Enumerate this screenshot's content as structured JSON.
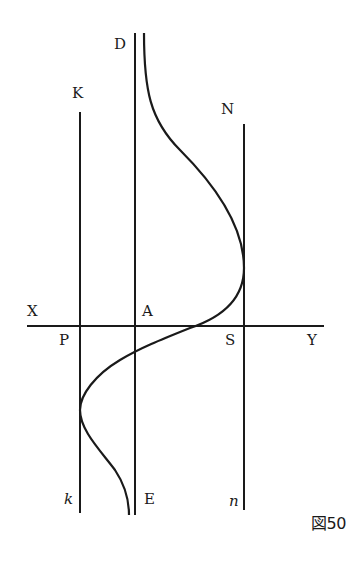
{
  "figure": {
    "caption": "図50",
    "labels": {
      "D": "D",
      "K": "K",
      "N": "N",
      "X": "X",
      "A": "A",
      "P": "P",
      "S": "S",
      "Y": "Y",
      "k": "k",
      "E": "E",
      "n": "n"
    },
    "colors": {
      "ink": "#1a1a1a",
      "background": "#ffffff"
    },
    "lines": [
      {
        "name": "K-k",
        "x": 80,
        "y1": 112,
        "y2": 513
      },
      {
        "name": "D-E",
        "x": 135,
        "y1": 33,
        "y2": 515
      },
      {
        "name": "N-n",
        "x": 244,
        "y1": 124,
        "y2": 510
      },
      {
        "name": "X-Y",
        "y": 326,
        "x1": 27,
        "x2": 324
      }
    ]
  }
}
